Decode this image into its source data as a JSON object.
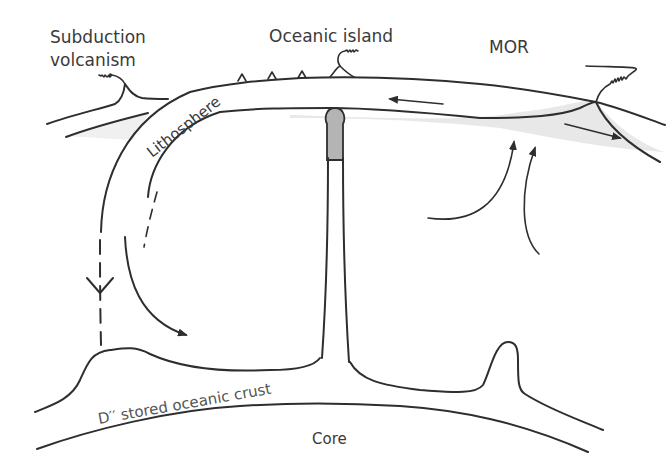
{
  "figure": {
    "type": "schematic cross-section of Earth mantle convection",
    "labels": {
      "subduction_line1": "Subduction",
      "subduction_line2": "volcanism",
      "oceanic_island": "Oceanic island",
      "mor": "MOR",
      "lithosphere": "Lithosphere",
      "d_double_prime": "D′′  stored oceanic crust",
      "core": "Core"
    },
    "colors": {
      "line": "#2e2e2e",
      "text": "#3a3a3a",
      "plume_head": "#b4b4b4",
      "melt_zone": "#e6e6e6",
      "background": "#ffffff"
    },
    "features": [
      "subducting slab (dashed path down to D'')",
      "mantle plume with grey head beneath oceanic island",
      "hotspot seamount chain (4 small peaks)",
      "mid-ocean ridge with grey melting zone",
      "upwelling arrows beneath MOR",
      "plate motion arrows (left and right of MOR)",
      "D'' layer bump above core-mantle boundary"
    ]
  }
}
